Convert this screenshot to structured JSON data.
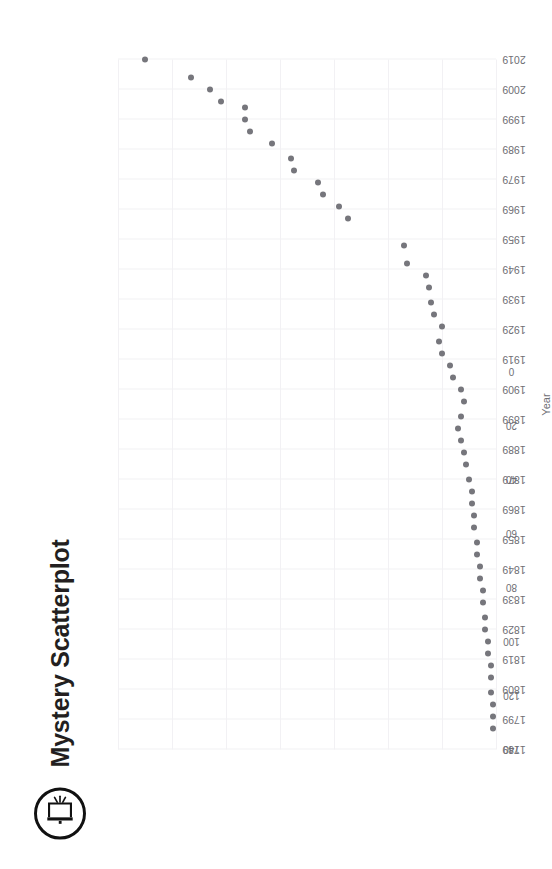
{
  "header": {
    "title": "Mystery Scatterplot",
    "logo_icon": "door-exit-in-circle-icon"
  },
  "colors": {
    "point": "#76767c",
    "grid": "#f2f1f4",
    "title_text": "#231f20",
    "axis_text": "#6f6f75",
    "background": "#ffffff"
  },
  "chart_data": {
    "type": "scatter",
    "title": "Mystery Scatterplot",
    "xlabel": "Year",
    "ylabel": "",
    "xlim": [
      1789,
      2019
    ],
    "ylim": [
      0,
      140
    ],
    "grid": true,
    "legend": null,
    "rotation_deg": -90,
    "xticks": [
      1789,
      1799,
      1809,
      1819,
      1829,
      1839,
      1849,
      1859,
      1869,
      1879,
      1889,
      1899,
      1909,
      1919,
      1929,
      1939,
      1949,
      1959,
      1969,
      1979,
      1989,
      1999,
      2009,
      2019
    ],
    "yticks": [
      0,
      20,
      40,
      60,
      80,
      100,
      120,
      140
    ],
    "points": [
      {
        "x": 2019,
        "y": 130
      },
      {
        "x": 2013,
        "y": 113
      },
      {
        "x": 2009,
        "y": 106
      },
      {
        "x": 2005,
        "y": 102
      },
      {
        "x": 2003,
        "y": 93
      },
      {
        "x": 1999,
        "y": 93
      },
      {
        "x": 1995,
        "y": 91
      },
      {
        "x": 1991,
        "y": 83
      },
      {
        "x": 1986,
        "y": 76
      },
      {
        "x": 1982,
        "y": 75
      },
      {
        "x": 1978,
        "y": 66
      },
      {
        "x": 1974,
        "y": 64
      },
      {
        "x": 1970,
        "y": 58
      },
      {
        "x": 1966,
        "y": 55
      },
      {
        "x": 1957,
        "y": 34
      },
      {
        "x": 1951,
        "y": 33
      },
      {
        "x": 1947,
        "y": 26
      },
      {
        "x": 1943,
        "y": 25
      },
      {
        "x": 1938,
        "y": 24
      },
      {
        "x": 1934,
        "y": 23
      },
      {
        "x": 1930,
        "y": 20
      },
      {
        "x": 1925,
        "y": 21
      },
      {
        "x": 1921,
        "y": 20
      },
      {
        "x": 1917,
        "y": 17
      },
      {
        "x": 1913,
        "y": 16
      },
      {
        "x": 1909,
        "y": 13
      },
      {
        "x": 1905,
        "y": 12
      },
      {
        "x": 1900,
        "y": 13
      },
      {
        "x": 1896,
        "y": 14
      },
      {
        "x": 1892,
        "y": 13
      },
      {
        "x": 1888,
        "y": 12
      },
      {
        "x": 1884,
        "y": 11
      },
      {
        "x": 1879,
        "y": 10
      },
      {
        "x": 1875,
        "y": 9
      },
      {
        "x": 1871,
        "y": 9
      },
      {
        "x": 1867,
        "y": 8
      },
      {
        "x": 1863,
        "y": 8
      },
      {
        "x": 1858,
        "y": 7
      },
      {
        "x": 1854,
        "y": 7
      },
      {
        "x": 1850,
        "y": 6
      },
      {
        "x": 1846,
        "y": 6
      },
      {
        "x": 1842,
        "y": 5
      },
      {
        "x": 1838,
        "y": 5
      },
      {
        "x": 1833,
        "y": 4
      },
      {
        "x": 1829,
        "y": 4
      },
      {
        "x": 1825,
        "y": 3
      },
      {
        "x": 1821,
        "y": 3
      },
      {
        "x": 1817,
        "y": 2
      },
      {
        "x": 1813,
        "y": 2
      },
      {
        "x": 1808,
        "y": 2
      },
      {
        "x": 1804,
        "y": 1
      },
      {
        "x": 1800,
        "y": 1
      },
      {
        "x": 1796,
        "y": 1
      }
    ]
  }
}
